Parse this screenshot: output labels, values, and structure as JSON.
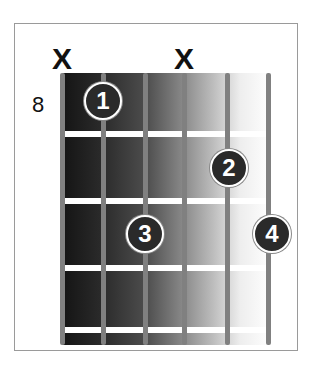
{
  "chord": {
    "start_fret": "8",
    "strings": 6,
    "muted_strings": [
      {
        "string": 1,
        "label": "X"
      },
      {
        "string": 4,
        "label": "X"
      }
    ],
    "fingers": [
      {
        "label": "1",
        "string": 2,
        "fret": 1
      },
      {
        "label": "2",
        "string": 5,
        "fret": 2
      },
      {
        "label": "3",
        "string": 3,
        "fret": 3
      },
      {
        "label": "4",
        "string": 6,
        "fret": 3
      }
    ]
  },
  "colors": {
    "finger_fill": "#2a2a2a",
    "finger_text": "#ffffff",
    "string": "#808080",
    "fret": "#ffffff"
  }
}
